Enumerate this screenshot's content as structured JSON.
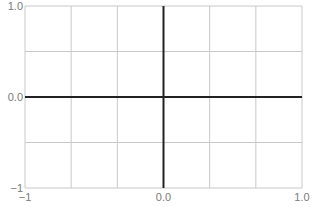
{
  "chart_data": {
    "type": "line",
    "title": "",
    "xlabel": "",
    "ylabel": "",
    "xlim": [
      -1,
      1
    ],
    "ylim": [
      -1,
      1
    ],
    "grid": true,
    "legend": null,
    "series": [],
    "x_ticks": [
      {
        "value": -1,
        "label": "−1"
      },
      {
        "value": 0,
        "label": "0.0"
      },
      {
        "value": 1,
        "label": "1.0"
      }
    ],
    "y_ticks": [
      {
        "value": 1,
        "label": "1.0"
      },
      {
        "value": 0,
        "label": "0.0"
      },
      {
        "value": -1,
        "label": "−1"
      }
    ],
    "grid_columns": 6,
    "grid_rows": 4,
    "axes_highlighted_at_zero": true
  },
  "colors": {
    "grid": "#c8c8c8",
    "axis": "#222222",
    "tick_label": "#7a7a7a",
    "background": "#ffffff"
  }
}
